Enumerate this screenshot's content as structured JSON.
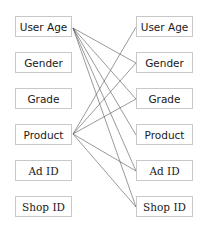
{
  "diagram": {
    "type": "bipartite-mapping",
    "left_column": [
      {
        "label": "User Age"
      },
      {
        "label": "Gender"
      },
      {
        "label": "Grade"
      },
      {
        "label": "Product"
      },
      {
        "label": "Ad ID"
      },
      {
        "label": "Shop ID"
      }
    ],
    "right_column": [
      {
        "label": "User Age"
      },
      {
        "label": "Gender"
      },
      {
        "label": "Grade"
      },
      {
        "label": "Product"
      },
      {
        "label": "Ad ID"
      },
      {
        "label": "Shop ID"
      }
    ],
    "edges": [
      {
        "from": "left:User Age",
        "to": "right:Gender"
      },
      {
        "from": "left:User Age",
        "to": "right:Grade"
      },
      {
        "from": "left:User Age",
        "to": "right:Product"
      },
      {
        "from": "left:User Age",
        "to": "right:Ad ID"
      },
      {
        "from": "left:User Age",
        "to": "right:Shop ID"
      },
      {
        "from": "left:Product",
        "to": "right:User Age"
      },
      {
        "from": "left:Product",
        "to": "right:Gender"
      },
      {
        "from": "left:Product",
        "to": "right:Grade"
      },
      {
        "from": "left:Product",
        "to": "right:Ad ID"
      },
      {
        "from": "left:Product",
        "to": "right:Shop ID"
      }
    ],
    "colors": {
      "border": "#c8c8c8",
      "line": "#555555",
      "text": "#1a1a1a"
    }
  }
}
